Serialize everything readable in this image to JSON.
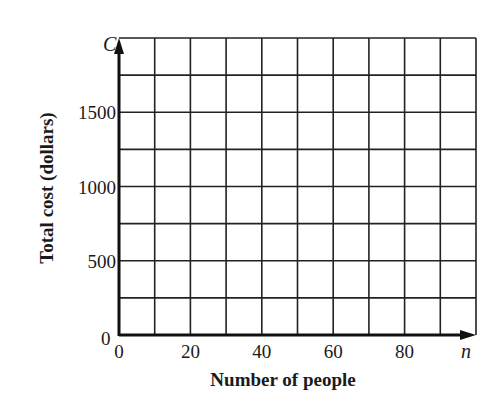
{
  "chart_data": {
    "type": "line",
    "title": "",
    "xlabel": "Number of people",
    "ylabel": "Total cost (dollars)",
    "x_var": "n",
    "y_var": "C",
    "x_ticks": [
      0,
      20,
      40,
      60,
      80
    ],
    "y_ticks": [
      0,
      500,
      1000,
      1500
    ],
    "y_origin_label": "0",
    "xlim": [
      0,
      100
    ],
    "ylim": [
      0,
      2000
    ],
    "x_grid_step": 10,
    "y_grid_step": 250,
    "grid": true,
    "series": []
  }
}
